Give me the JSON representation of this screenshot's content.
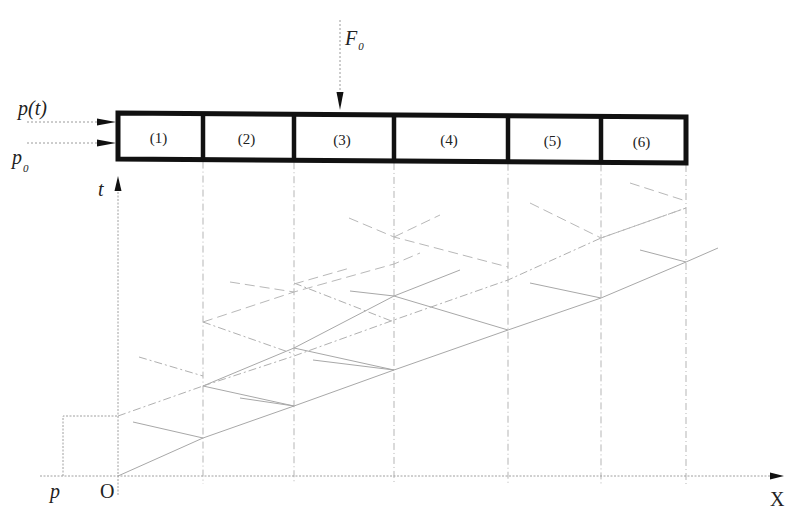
{
  "figure": {
    "type": "wave-propagation-characteristics-diagram",
    "labels": {
      "force": "F",
      "force_sub": "0",
      "pressure_t": "p(t)",
      "pressure_0": "p",
      "pressure_0_sub": "0",
      "t_axis": "t",
      "p_axis": "p",
      "origin": "O",
      "x_axis": "X"
    },
    "segments": [
      {
        "label": "(1)",
        "x0": 118,
        "x1": 203
      },
      {
        "label": "(2)",
        "x0": 203,
        "x1": 294
      },
      {
        "label": "(3)",
        "x0": 294,
        "x1": 394
      },
      {
        "label": "(4)",
        "x0": 394,
        "x1": 508
      },
      {
        "label": "(5)",
        "x0": 508,
        "x1": 601
      },
      {
        "label": "(6)",
        "x0": 601,
        "x1": 686
      }
    ],
    "rod": {
      "y_top": 113,
      "y_bottom": 160
    },
    "boundaries_x": [
      118,
      203,
      294,
      394,
      508,
      601,
      686
    ],
    "axes": {
      "origin": [
        118,
        476
      ],
      "x_end": 780,
      "t_top": 178,
      "p_left_x": 63,
      "p_level_y": 416
    }
  },
  "chart_data": {
    "type": "diagram",
    "title": "",
    "segments": [
      "(1)",
      "(2)",
      "(3)",
      "(4)",
      "(5)",
      "(6)"
    ],
    "xlabel": "X",
    "ylabel": "t",
    "left_axis_label": "p",
    "origin_label": "O",
    "inputs": [
      "p(t)",
      "p0",
      "F0"
    ],
    "characteristics": {
      "solid": [
        [
          [
            118,
            476
          ],
          [
            203,
            438
          ],
          [
            294,
            406
          ],
          [
            394,
            370
          ],
          [
            508,
            330
          ],
          [
            601,
            298
          ],
          [
            686,
            262
          ],
          [
            718,
            248
          ]
        ],
        [
          [
            133,
            422
          ],
          [
            203,
            438
          ]
        ],
        [
          [
            203,
            386
          ],
          [
            294,
            406
          ]
        ],
        [
          [
            240,
            398
          ],
          [
            294,
            406
          ]
        ],
        [
          [
            294,
            348
          ],
          [
            394,
            370
          ]
        ],
        [
          [
            313,
            360
          ],
          [
            394,
            370
          ]
        ],
        [
          [
            394,
            296
          ],
          [
            508,
            330
          ]
        ],
        [
          [
            350,
            291
          ],
          [
            394,
            296
          ]
        ],
        [
          [
            530,
            283
          ],
          [
            601,
            298
          ]
        ],
        [
          [
            640,
            250
          ],
          [
            686,
            262
          ]
        ],
        [
          [
            203,
            386
          ],
          [
            294,
            348
          ],
          [
            394,
            296
          ],
          [
            460,
            270
          ]
        ]
      ],
      "dashdot": [
        [
          [
            118,
            416
          ],
          [
            203,
            386
          ]
        ],
        [
          [
            203,
            386
          ],
          [
            294,
            356
          ],
          [
            394,
            320
          ],
          [
            508,
            280
          ],
          [
            601,
            238
          ],
          [
            686,
            208
          ]
        ],
        [
          [
            139,
            357
          ],
          [
            203,
            376
          ]
        ],
        [
          [
            203,
            322
          ],
          [
            294,
            354
          ]
        ],
        [
          [
            294,
            283
          ],
          [
            394,
            322
          ]
        ]
      ],
      "dashed": [
        [
          [
            203,
            322
          ],
          [
            294,
            292
          ],
          [
            394,
            264
          ],
          [
            420,
            253
          ]
        ],
        [
          [
            230,
            282
          ],
          [
            294,
            292
          ]
        ],
        [
          [
            294,
            284
          ],
          [
            350,
            268
          ]
        ],
        [
          [
            349,
            218
          ],
          [
            394,
            237
          ],
          [
            508,
            267
          ]
        ],
        [
          [
            394,
            237
          ],
          [
            440,
            215
          ]
        ],
        [
          [
            530,
            203
          ],
          [
            601,
            238
          ]
        ],
        [
          [
            601,
            238
          ],
          [
            686,
            208
          ]
        ],
        [
          [
            630,
            183
          ],
          [
            686,
            201
          ]
        ]
      ]
    }
  }
}
